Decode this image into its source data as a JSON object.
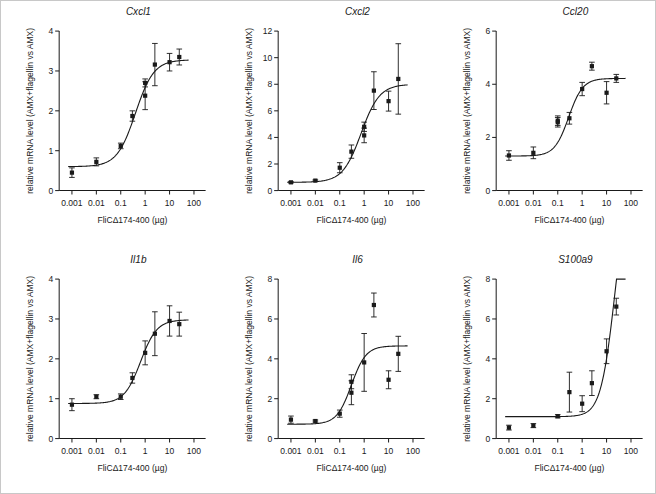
{
  "figure": {
    "xlabel": "FliCΔ174-400 (µg)",
    "ylabel": "relative mRNA level (AMX+flagellin vs AMX)",
    "xticklabels": [
      "0.001",
      "0.01",
      "0.1",
      "1",
      "10",
      "100"
    ],
    "xtickvalues": [
      0.001,
      0.01,
      0.1,
      1,
      10,
      100
    ],
    "marker_color": "#1a1a1a",
    "curve_color": "#1a1a1a",
    "border_color": "#c8c8c8"
  },
  "chart_data": [
    {
      "type": "scatter",
      "title": "Cxcl1",
      "xlabel": "FliCΔ174-400 (µg)",
      "ylabel": "relative mRNA level (AMX+flagellin vs AMX)",
      "xscale": "log",
      "xlim": [
        0.0003,
        300
      ],
      "ylim": [
        0,
        4
      ],
      "yticks": [
        0,
        1,
        2,
        3,
        4
      ],
      "yticklabels": [
        "0",
        "1",
        "2",
        "3",
        "4"
      ],
      "grid": false,
      "legend": "none",
      "x": [
        0.001,
        0.01,
        0.1,
        0.3,
        1.0,
        1.0,
        2.5,
        10,
        25
      ],
      "y": [
        0.45,
        0.72,
        1.12,
        1.87,
        2.7,
        2.38,
        3.16,
        3.22,
        3.35
      ],
      "yerr": [
        0.12,
        0.1,
        0.07,
        0.13,
        0.1,
        0.35,
        0.53,
        0.22,
        0.2
      ],
      "fit": {
        "bottom": 0.6,
        "top": 3.28,
        "ec50": 0.4,
        "hill": 1.15
      }
    },
    {
      "type": "scatter",
      "title": "Cxcl2",
      "xlabel": "FliCΔ174-400 (µg)",
      "ylabel": "relative mRNA level (AMX+flagellin vs AMX)",
      "xscale": "log",
      "xlim": [
        0.0003,
        300
      ],
      "ylim": [
        0,
        12
      ],
      "yticks": [
        0,
        2,
        4,
        6,
        8,
        10,
        12
      ],
      "yticklabels": [
        "0",
        "2",
        "4",
        "6",
        "8",
        "10",
        "12"
      ],
      "grid": false,
      "legend": "none",
      "x": [
        0.001,
        0.01,
        0.1,
        0.3,
        1.0,
        1.0,
        2.5,
        10,
        25
      ],
      "y": [
        0.62,
        0.75,
        1.72,
        2.93,
        4.8,
        4.15,
        7.52,
        6.73,
        8.4
      ],
      "yerr": [
        0.05,
        0.05,
        0.38,
        0.5,
        0.35,
        0.55,
        1.42,
        0.75,
        2.65
      ],
      "fit": {
        "bottom": 0.62,
        "top": 8.0,
        "ec50": 0.75,
        "hill": 1.15
      }
    },
    {
      "type": "scatter",
      "title": "Ccl20",
      "xlabel": "FliCΔ174-400 (µg)",
      "ylabel": "relative mRNA level (AMX+flagellin vs AMX)",
      "xscale": "log",
      "xlim": [
        0.0003,
        300
      ],
      "ylim": [
        0,
        6
      ],
      "yticks": [
        0,
        2,
        4,
        6
      ],
      "yticklabels": [
        "0",
        "2",
        "4",
        "6"
      ],
      "grid": false,
      "legend": "none",
      "x": [
        0.001,
        0.01,
        0.1,
        0.1,
        0.3,
        1.0,
        2.5,
        10,
        25
      ],
      "y": [
        1.32,
        1.42,
        2.63,
        2.57,
        2.72,
        3.82,
        4.68,
        3.68,
        4.22
      ],
      "yerr": [
        0.18,
        0.22,
        0.18,
        0.18,
        0.22,
        0.25,
        0.15,
        0.42,
        0.15
      ],
      "fit": {
        "bottom": 1.3,
        "top": 4.22,
        "ec50": 0.28,
        "hill": 1.5
      }
    },
    {
      "type": "scatter",
      "title": "Il1b",
      "xlabel": "FliCΔ174-400 (µg)",
      "ylabel": "relative mRNA level (AMX+flagellin vs AMX)",
      "xscale": "log",
      "xlim": [
        0.0003,
        300
      ],
      "ylim": [
        0,
        4
      ],
      "yticks": [
        0,
        1,
        2,
        3,
        4
      ],
      "yticklabels": [
        "0",
        "1",
        "2",
        "3",
        "4"
      ],
      "grid": false,
      "legend": "none",
      "x": [
        0.001,
        0.01,
        0.1,
        0.3,
        1.0,
        2.5,
        10,
        25
      ],
      "y": [
        0.85,
        1.05,
        1.05,
        1.52,
        2.15,
        2.63,
        2.95,
        2.87
      ],
      "yerr": [
        0.15,
        0.05,
        0.07,
        0.13,
        0.3,
        0.55,
        0.38,
        0.3
      ],
      "fit": {
        "bottom": 0.88,
        "top": 2.98,
        "ec50": 0.65,
        "hill": 1.3
      }
    },
    {
      "type": "scatter",
      "title": "Il6",
      "xlabel": "FliCΔ174-400 (µg)",
      "ylabel": "relative mRNA level (AMX+flagellin vs AMX)",
      "xscale": "log",
      "xlim": [
        0.0003,
        300
      ],
      "ylim": [
        0,
        8
      ],
      "yticks": [
        0,
        2,
        4,
        6,
        8
      ],
      "yticklabels": [
        "0",
        "2",
        "4",
        "6",
        "8"
      ],
      "grid": false,
      "legend": "none",
      "x": [
        0.001,
        0.01,
        0.1,
        0.3,
        0.3,
        1.0,
        2.5,
        10,
        25
      ],
      "y": [
        0.95,
        0.88,
        1.25,
        2.3,
        2.85,
        3.82,
        6.7,
        2.95,
        4.25
      ],
      "yerr": [
        0.18,
        0.05,
        0.18,
        0.6,
        0.35,
        1.45,
        0.6,
        0.45,
        0.88
      ],
      "fit": {
        "bottom": 0.72,
        "top": 4.65,
        "ec50": 0.3,
        "hill": 1.45
      }
    },
    {
      "type": "scatter",
      "title": "S100a9",
      "xlabel": "FliCΔ174-400 (µg)",
      "ylabel": "relative mRNA level (AMX+flagellin vs AMX)",
      "xscale": "log",
      "xlim": [
        0.0003,
        300
      ],
      "ylim": [
        0,
        8
      ],
      "yticks": [
        0,
        2,
        4,
        6,
        8
      ],
      "yticklabels": [
        "0",
        "2",
        "4",
        "6",
        "8"
      ],
      "grid": false,
      "legend": "none",
      "x": [
        0.001,
        0.01,
        0.1,
        0.3,
        1.0,
        2.5,
        10,
        25
      ],
      "y": [
        0.55,
        0.65,
        1.12,
        2.33,
        1.75,
        2.78,
        4.38,
        6.62
      ],
      "yerr": [
        0.12,
        0.1,
        0.08,
        1.0,
        0.4,
        0.62,
        0.62,
        0.42
      ],
      "fit": {
        "bottom": 1.1,
        "top": 13.5,
        "ec50": 22.0,
        "hill": 1.5
      }
    }
  ]
}
